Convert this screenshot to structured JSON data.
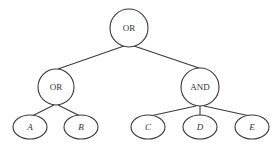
{
  "diagram": {
    "type": "tree",
    "colors": {
      "stroke": "#3a3a3a",
      "text": "#333333",
      "background": "#ffffff"
    },
    "nodes": [
      {
        "id": "root",
        "label": "OR",
        "shape": "circle",
        "cx": 129,
        "cy": 28,
        "r": 19
      },
      {
        "id": "or2",
        "label": "OR",
        "shape": "circle",
        "cx": 56,
        "cy": 87,
        "r": 18
      },
      {
        "id": "and",
        "label": "AND",
        "shape": "circle",
        "cx": 200,
        "cy": 87,
        "r": 19
      },
      {
        "id": "a",
        "label": "A",
        "shape": "ellipse",
        "cx": 30,
        "cy": 127,
        "rx": 17,
        "ry": 12
      },
      {
        "id": "b",
        "label": "B",
        "shape": "ellipse",
        "cx": 81,
        "cy": 127,
        "rx": 17,
        "ry": 12
      },
      {
        "id": "c",
        "label": "C",
        "shape": "ellipse",
        "cx": 148,
        "cy": 127,
        "rx": 17,
        "ry": 12
      },
      {
        "id": "d",
        "label": "D",
        "shape": "ellipse",
        "cx": 200,
        "cy": 127,
        "rx": 17,
        "ry": 12
      },
      {
        "id": "e",
        "label": "E",
        "shape": "ellipse",
        "cx": 252,
        "cy": 127,
        "rx": 17,
        "ry": 12
      }
    ],
    "edges": [
      {
        "from": "root",
        "to": "or2"
      },
      {
        "from": "root",
        "to": "and"
      },
      {
        "from": "or2",
        "to": "a"
      },
      {
        "from": "or2",
        "to": "b"
      },
      {
        "from": "and",
        "to": "c"
      },
      {
        "from": "and",
        "to": "d"
      },
      {
        "from": "and",
        "to": "e"
      }
    ]
  }
}
